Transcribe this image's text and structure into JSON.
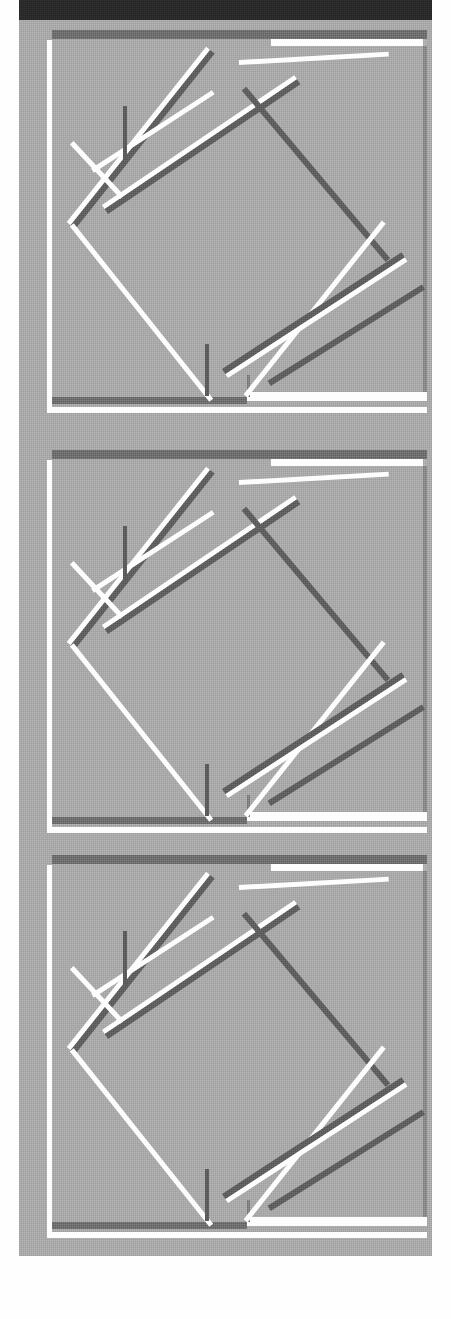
{
  "document": {
    "kind": "scanned-grayscale-figure",
    "page_width": 451,
    "page_height": 1319,
    "title": "",
    "caption": "",
    "visible_text": ""
  },
  "palette": {
    "page_white": "#fefefe",
    "scan_gray": "#a9a9a9",
    "top_bar_black": "#2a2a2a",
    "bevel_highlight": "#fdfdfd",
    "bevel_shadow": "#5f5f5f",
    "frame_shadow": "#6e6e6e"
  },
  "layout": {
    "top_bar": {
      "x": 19,
      "y": 0,
      "w": 413,
      "h": 20
    },
    "scan_body": {
      "x": 19,
      "y": 20,
      "w": 413,
      "h": 1236
    },
    "left_margin_w": 19,
    "right_margin_w": 19,
    "bottom_white_y": 1256
  },
  "panels": [
    {
      "index": 1,
      "top": 0,
      "label": ""
    },
    {
      "index": 2,
      "top": 420,
      "label": ""
    },
    {
      "index": 3,
      "top": 825,
      "label": ""
    }
  ],
  "figure": {
    "type": "rotated-square-in-frame",
    "frame": {
      "x": 28,
      "y": 10,
      "w": 380,
      "h": 383
    },
    "diamond_vertices": [
      {
        "name": "top",
        "x": 228,
        "y": 22
      },
      {
        "name": "right",
        "x": 364,
        "y": 196
      },
      {
        "name": "bottom",
        "x": 190,
        "y": 374
      },
      {
        "name": "left",
        "x": 52,
        "y": 200
      }
    ],
    "edges": [
      {
        "from": "left",
        "to": "top",
        "style": "highlight-over-shadow"
      },
      {
        "from": "top",
        "to": "right",
        "style": "shadow-only"
      },
      {
        "from": "right",
        "to": "bottom",
        "style": "highlight-over-shadow"
      },
      {
        "from": "bottom",
        "to": "left",
        "style": "highlight-only"
      }
    ],
    "extra_strokes": [
      {
        "name": "upper-inner-parallel",
        "style": "highlight-over-shadow"
      },
      {
        "name": "lower-inner-parallel",
        "style": "highlight-over-shadow"
      },
      {
        "name": "left-notch",
        "style": "highlight-only"
      }
    ]
  }
}
